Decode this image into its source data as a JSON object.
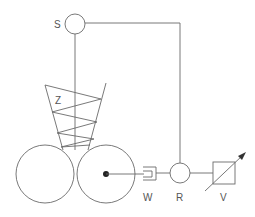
{
  "diagram": {
    "labels": {
      "S": "S",
      "Z": "Z",
      "W": "W",
      "R": "R",
      "V": "V"
    },
    "components": [
      {
        "id": "S",
        "shape": "circle",
        "cx": 75,
        "cy": 24,
        "r": 10
      },
      {
        "id": "Z",
        "shape": "funnel-with-zigzag"
      },
      {
        "id": "left-roller",
        "shape": "circle",
        "cx": 45,
        "cy": 174,
        "r": 29
      },
      {
        "id": "right-roller",
        "shape": "circle",
        "cx": 106,
        "cy": 174,
        "r": 29
      },
      {
        "id": "W",
        "shape": "bracket"
      },
      {
        "id": "R",
        "shape": "circle",
        "cx": 180,
        "cy": 173,
        "r": 10
      },
      {
        "id": "V",
        "shape": "square-with-diagonal-arrow"
      }
    ],
    "colors": {
      "line": "#6a6a6a",
      "text": "#555555",
      "background": "#ffffff"
    }
  }
}
